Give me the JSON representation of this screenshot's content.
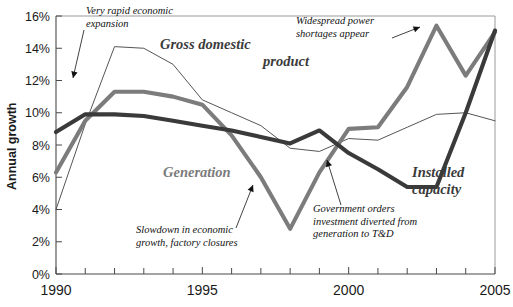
{
  "chart_data": {
    "type": "line",
    "title": "",
    "xlabel": "",
    "ylabel": "Annual growth",
    "xlim": [
      1990,
      2005
    ],
    "ylim": [
      0,
      16
    ],
    "ytick_labels": [
      "0%",
      "2%",
      "4%",
      "6%",
      "8%",
      "10%",
      "12%",
      "14%",
      "16%"
    ],
    "ytick_values": [
      0,
      2,
      4,
      6,
      8,
      10,
      12,
      14,
      16
    ],
    "xtick_labels": [
      "1990",
      "1995",
      "2000",
      "2005"
    ],
    "xtick_values": [
      1990,
      1995,
      2000,
      2005
    ],
    "minor_xticks": [
      1991,
      1992,
      1993,
      1994,
      1996,
      1997,
      1998,
      1999,
      2001,
      2002,
      2003,
      2004
    ],
    "grid": false,
    "legend": "inline-labels",
    "x": [
      1990,
      1991,
      1992,
      1993,
      1994,
      1995,
      1996,
      1997,
      1998,
      1999,
      2000,
      2001,
      2002,
      2003,
      2004,
      2005
    ],
    "series": [
      {
        "name": "Gross domestic product",
        "label": "Gross domestic product",
        "color": "#555555",
        "style": "thin",
        "values": [
          4.0,
          9.3,
          14.1,
          14.0,
          13.0,
          10.8,
          10.0,
          9.2,
          7.8,
          7.6,
          8.4,
          8.3,
          9.1,
          9.9,
          10.0,
          9.5
        ]
      },
      {
        "name": "Generation",
        "label": "Generation",
        "color": "#7c7c7c",
        "style": "thick",
        "values": [
          6.3,
          9.5,
          11.3,
          11.3,
          11.0,
          10.5,
          8.6,
          6.0,
          2.8,
          6.3,
          9.0,
          9.1,
          11.6,
          15.4,
          12.3,
          15.0
        ]
      },
      {
        "name": "Installed capacity",
        "label": "Installed capacity",
        "color": "#3a3a3a",
        "style": "thick",
        "values": [
          8.8,
          9.9,
          9.9,
          9.8,
          9.5,
          9.2,
          8.9,
          8.5,
          8.1,
          8.9,
          7.5,
          6.5,
          5.4,
          5.4,
          10.0,
          15.1
        ]
      }
    ],
    "annotations": [
      {
        "id": "annotation-rapid-expansion",
        "text_lines": [
          "Very rapid economic",
          "expansion"
        ],
        "x": 86,
        "y": 14,
        "leader": {
          "x1": 84,
          "y1": 30,
          "x2": 73,
          "y2": 78
        }
      },
      {
        "id": "annotation-power-shortages",
        "text_lines": [
          "Widespread power",
          "shortages appear"
        ],
        "x": 296,
        "y": 24,
        "leader": {
          "x1": 392,
          "y1": 38,
          "x2": 420,
          "y2": 27
        }
      },
      {
        "id": "annotation-slowdown",
        "text_lines": [
          "Slowdown in economic",
          "growth, factory closures"
        ],
        "x": 136,
        "y": 233,
        "leader": {
          "x1": 236,
          "y1": 228,
          "x2": 253,
          "y2": 185
        }
      },
      {
        "id": "annotation-government-orders",
        "text_lines": [
          "Government orders",
          "investment diverted from",
          "generation to T&D"
        ],
        "x": 313,
        "y": 212,
        "leader": {
          "x1": 341,
          "y1": 205,
          "x2": 327,
          "y2": 160
        }
      }
    ],
    "series_labels": [
      {
        "id": "series-label-gdp",
        "text_lines": [
          "Gross domestic",
          "product"
        ],
        "x": 160,
        "y": 49,
        "align": "start",
        "tone": "dark"
      },
      {
        "id": "series-label-generation",
        "text_lines": [
          "Generation"
        ],
        "x": 163,
        "y": 177,
        "align": "start",
        "tone": "gray"
      },
      {
        "id": "series-label-capacity",
        "text_lines": [
          "Installed",
          "capacity"
        ],
        "x": 412,
        "y": 177,
        "align": "start",
        "tone": "dark"
      }
    ]
  }
}
